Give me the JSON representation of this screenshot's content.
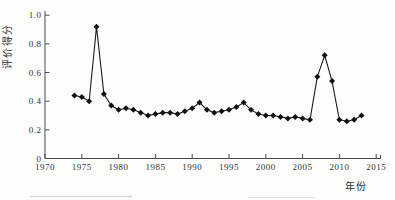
{
  "chart_data": {
    "type": "line",
    "title": "",
    "xlabel": "年份",
    "ylabel": "评价得分",
    "marker": "diamond",
    "grid": false,
    "legend": null,
    "xlim": [
      1970,
      2015
    ],
    "ylim": [
      0,
      1.0
    ],
    "x_ticks": [
      1970,
      1975,
      1980,
      1985,
      1990,
      1995,
      2000,
      2005,
      2010,
      2015
    ],
    "y_ticks": [
      0,
      0.2,
      0.4,
      0.6,
      0.8,
      1.0
    ],
    "y_tick_labels": [
      "0",
      "0.2",
      "0.4",
      "0.6",
      "0.8",
      "1.0"
    ],
    "x": [
      1974,
      1975,
      1976,
      1977,
      1978,
      1979,
      1980,
      1981,
      1982,
      1983,
      1984,
      1985,
      1986,
      1987,
      1988,
      1989,
      1990,
      1991,
      1992,
      1993,
      1994,
      1995,
      1996,
      1997,
      1998,
      1999,
      2000,
      2001,
      2002,
      2003,
      2004,
      2005,
      2006,
      2007,
      2008,
      2009,
      2010,
      2011,
      2012,
      2013
    ],
    "values": [
      0.44,
      0.43,
      0.4,
      0.92,
      0.45,
      0.37,
      0.34,
      0.35,
      0.34,
      0.32,
      0.3,
      0.31,
      0.32,
      0.32,
      0.31,
      0.33,
      0.35,
      0.39,
      0.34,
      0.32,
      0.33,
      0.34,
      0.36,
      0.39,
      0.34,
      0.31,
      0.3,
      0.3,
      0.29,
      0.28,
      0.29,
      0.28,
      0.27,
      0.57,
      0.72,
      0.54,
      0.27,
      0.26,
      0.27,
      0.3
    ],
    "line_color": "#1b1b1b",
    "marker_color": "#121212",
    "axis_color": "#4a4a4a",
    "text_color": "#333333"
  }
}
